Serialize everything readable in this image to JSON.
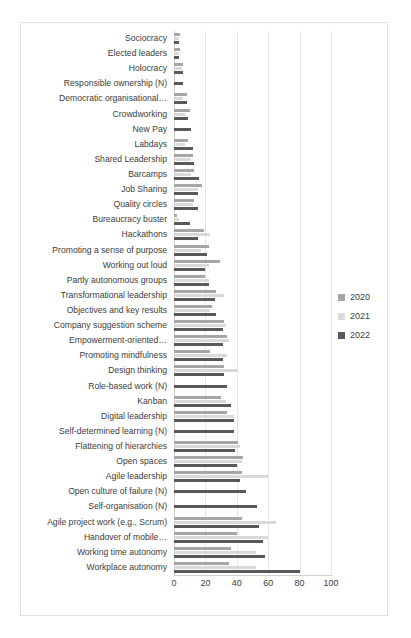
{
  "chart_data": {
    "type": "bar",
    "orientation": "horizontal",
    "title": "",
    "xlabel": "",
    "ylabel": "",
    "xlim": [
      0,
      100
    ],
    "xticks": [
      0,
      20,
      40,
      60,
      80,
      100
    ],
    "grid": true,
    "legend_position": "right",
    "categories": [
      "Sociocracy",
      "Elected leaders",
      "Holocracy",
      "Responsible ownership (N)",
      "Democratic organisational…",
      "Crowdworking",
      "New Pay",
      "Labdays",
      "Shared Leadership",
      "Barcamps",
      "Job Sharing",
      "Quality circles",
      "Bureaucracy buster",
      "Hackathons",
      "Promoting a sense of purpose",
      "Working out loud",
      "Partly autonomous groups",
      "Transformational leadership",
      "Objectives and key results",
      "Company suggestion scheme",
      "Empowerment-oriented…",
      "Promoting mindfulness",
      "Design thinking",
      "Role-based work (N)",
      "Kanban",
      "Digital leadership",
      "Self-determined learning (N)",
      "Flattening of hierarchies",
      "Open spaces",
      "Agile leadership",
      "Open culture of failure (N)",
      "Self-organisation (N)",
      "Agile project work (e.g., Scrum)",
      "Handover of mobile…",
      "Working time autonomy",
      "Workplace autonomy"
    ],
    "series": [
      {
        "name": "2020",
        "color": "#a6a6a6",
        "values": [
          4,
          4,
          6,
          0,
          8,
          10,
          0,
          9,
          12,
          13,
          18,
          13,
          2,
          19,
          22,
          29,
          20,
          27,
          24,
          32,
          34,
          23,
          32,
          0,
          30,
          34,
          0,
          41,
          44,
          43,
          0,
          0,
          43,
          40,
          36,
          35
        ]
      },
      {
        "name": "2021",
        "color": "#d9d9d9",
        "values": [
          3,
          3,
          5,
          0,
          6,
          7,
          0,
          7,
          11,
          11,
          15,
          12,
          3,
          23,
          17,
          22,
          22,
          32,
          23,
          33,
          35,
          34,
          40,
          0,
          33,
          38,
          0,
          42,
          43,
          60,
          0,
          0,
          65,
          60,
          52,
          52
        ]
      },
      {
        "name": "2022",
        "color": "#595959",
        "values": [
          3,
          3,
          6,
          6,
          8,
          9,
          11,
          12,
          13,
          16,
          15,
          15,
          10,
          15,
          21,
          20,
          22,
          26,
          27,
          31,
          31,
          31,
          32,
          34,
          36,
          38,
          38,
          39,
          40,
          42,
          46,
          53,
          54,
          57,
          58,
          80
        ]
      }
    ]
  },
  "legend": {
    "items": [
      {
        "label": "2020",
        "color": "#a6a6a6"
      },
      {
        "label": "2021",
        "color": "#d9d9d9"
      },
      {
        "label": "2022",
        "color": "#595959"
      }
    ]
  }
}
